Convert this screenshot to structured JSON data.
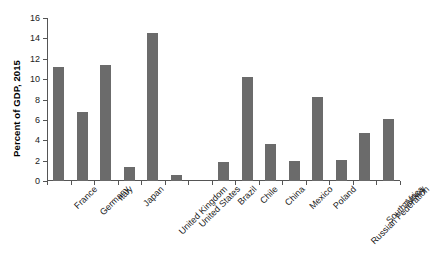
{
  "chart_data": {
    "type": "bar",
    "title": "",
    "xlabel": "",
    "ylabel": "Percent of GDP, 2015",
    "ylim": [
      0,
      16
    ],
    "yticks": [
      0,
      2,
      4,
      6,
      8,
      10,
      12,
      14,
      16
    ],
    "ytick_labels": [
      "0",
      "2",
      "4",
      "6",
      "8",
      "10",
      "12",
      "14",
      "16"
    ],
    "grid": false,
    "legend": null,
    "bar_color": "#6b6b6b",
    "axis_color": "#555555",
    "categories": [
      "France",
      "Germany",
      "Italy",
      "Japan",
      "United Kingdom",
      "United States",
      "",
      "Brazil",
      "Chile",
      "China",
      "Mexico",
      "Poland",
      "Russian Federation",
      "South Africa",
      "Turkey"
    ],
    "values": [
      11.2,
      6.8,
      11.4,
      1.4,
      14.5,
      0.6,
      null,
      1.85,
      10.2,
      3.65,
      1.95,
      8.2,
      2.05,
      4.7,
      6.1
    ],
    "groups": [
      {
        "name": "Advanced economies",
        "categories": [
          "France",
          "Germany",
          "Italy",
          "Japan",
          "United Kingdom",
          "United States"
        ],
        "values": [
          11.2,
          6.8,
          11.4,
          1.4,
          14.5,
          0.6
        ]
      },
      {
        "name": "Emerging economies",
        "categories": [
          "Brazil",
          "Chile",
          "China",
          "Mexico",
          "Poland",
          "Russian Federation",
          "South Africa",
          "Turkey"
        ],
        "values": [
          1.85,
          10.2,
          3.65,
          1.95,
          8.2,
          2.05,
          4.7,
          6.1
        ]
      }
    ]
  }
}
